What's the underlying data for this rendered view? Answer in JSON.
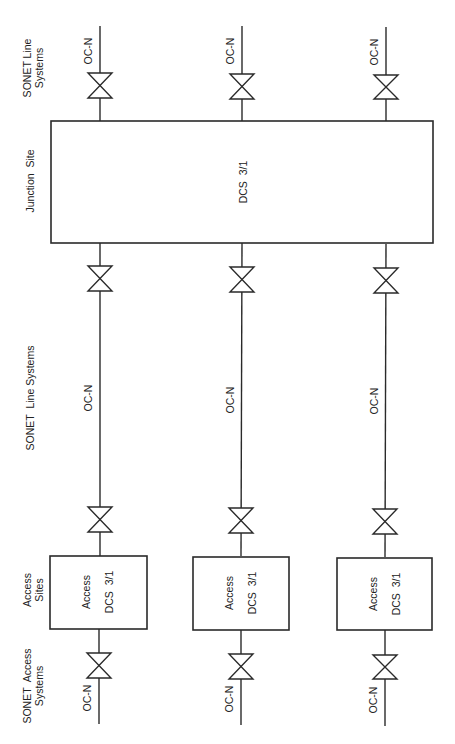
{
  "diagram": {
    "orientation": "rotated -90deg (text reads bottom-to-top)",
    "row_labels": {
      "top_line_systems": [
        "SONET Line",
        "Systems"
      ],
      "junction_site": "Junction  Site",
      "middle_line_systems": "SONET  Line Systems",
      "access_sites": [
        "Access",
        "Sites"
      ],
      "access_systems": [
        "SONET  Access",
        "Systems"
      ]
    },
    "junction": {
      "label": "DCS  3/1"
    },
    "access_boxes": [
      {
        "line1": "Access",
        "line2": "DCS  3/1"
      },
      {
        "line1": "Access",
        "line2": "DCS  3/1"
      },
      {
        "line1": "Access",
        "line2": "DCS  3/1"
      }
    ],
    "link_labels": {
      "top": [
        "OC-N",
        "OC-N",
        "OC-N"
      ],
      "middle": [
        "OC-N",
        "OC-N",
        "OC-N"
      ],
      "bottom": [
        "OC-N",
        "OC-N",
        "OC-N"
      ]
    },
    "colors": {
      "line": "#2a2a2a",
      "background": "#ffffff"
    }
  }
}
